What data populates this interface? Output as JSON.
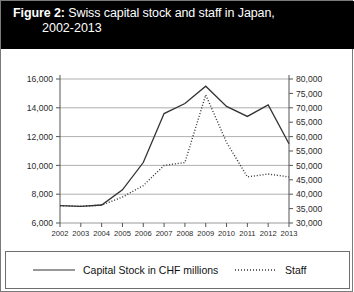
{
  "figure": {
    "label": "Figure 2:",
    "title_line1": "Swiss capital stock and staff in Japan,",
    "title_line2": "2002-2013",
    "banner_color": "#000000",
    "banner_text_color": "#ffffff"
  },
  "legend": {
    "capital_label": "Capital Stock in CHF millions",
    "capital_style": "solid-line-swatch",
    "staff_label": "Staff",
    "staff_style": "dotted-line-swatch",
    "position": "bottom"
  },
  "chart_data": {
    "type": "line",
    "title": "Swiss capital stock and staff in Japan, 2002-2013",
    "xlabel": "",
    "ylabel": "",
    "grid": true,
    "categories": [
      "2002",
      "2003",
      "2004",
      "2005",
      "2006",
      "2007",
      "2008",
      "2009",
      "2010",
      "2011",
      "2012",
      "2013"
    ],
    "left_axis": {
      "name": "Capital Stock in CHF millions",
      "ylim": [
        6000,
        16000
      ],
      "tick_step": 2000,
      "ticks": [
        6000,
        8000,
        10000,
        12000,
        14000,
        16000
      ],
      "tick_labels": [
        "6,000",
        "8,000",
        "10,000",
        "12,000",
        "14,000",
        "16,000"
      ]
    },
    "right_axis": {
      "name": "Staff",
      "ylim": [
        30000,
        80000
      ],
      "tick_step": 5000,
      "ticks": [
        30000,
        35000,
        40000,
        45000,
        50000,
        55000,
        60000,
        65000,
        70000,
        75000,
        80000
      ],
      "tick_labels": [
        "30,000",
        "35,000",
        "40,000",
        "45,000",
        "50,000",
        "55,000",
        "60,000",
        "65,000",
        "70,000",
        "75,000",
        "80,000"
      ]
    },
    "series": [
      {
        "name": "Capital Stock in CHF millions",
        "axis": "left",
        "style": "solid",
        "color": "#333333",
        "values": [
          7200,
          7150,
          7250,
          8300,
          10200,
          13600,
          14300,
          15500,
          14100,
          13400,
          14200,
          11500
        ]
      },
      {
        "name": "Staff",
        "axis": "right",
        "style": "dotted",
        "color": "#333333",
        "values": [
          36000,
          35800,
          36200,
          39000,
          43000,
          50000,
          51000,
          74500,
          58000,
          46000,
          47000,
          46000
        ]
      }
    ]
  }
}
